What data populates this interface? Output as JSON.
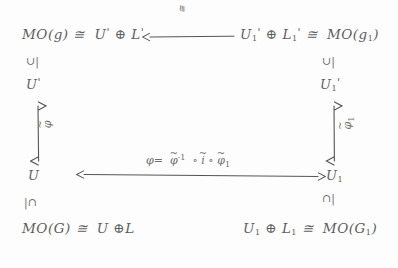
{
  "diagram": {
    "title_kind": "handwritten commutative diagram",
    "nodes": {
      "top_left": "MO(g) ≅ U' ⊕ L'",
      "top_right": "U₁' ⊕ L₁' ≅ MO(g₁)",
      "mid_left_upper": "U'",
      "mid_right_upper": "U₁'",
      "mid_left_lower": "U",
      "mid_right_lower": "U₁",
      "bottom_left": "MO(G) ≅ U ⊕ L",
      "bottom_right": "U₁ ⊕ L₁ ≅ MO(G₁)"
    },
    "parts": {
      "mo": "MO",
      "g_lower": "g",
      "g_upper": "G",
      "cong": "≅",
      "oplus": "⊕",
      "U": "U",
      "L": "L",
      "prime": "'",
      "one": "1",
      "paren_open": "(",
      "paren_close": ")"
    },
    "membership_marks": {
      "left_top": "∪|",
      "right_top": "∪|",
      "left_bottom": "|∩",
      "right_bottom": "∩|"
    },
    "arrows": {
      "top": {
        "name": "top-horizontal-arrow",
        "direction": "left",
        "label": "≅"
      },
      "bottom": {
        "name": "bottom-horizontal-arrow",
        "direction": "both",
        "label": "φ = φ̃⁻¹ ∘ ĩ ∘ φ̃₁"
      },
      "left": {
        "name": "left-vertical-arrow",
        "direction": "both",
        "label": "φ̃"
      },
      "right": {
        "name": "right-vertical-arrow",
        "direction": "both",
        "label": "φ̃₁"
      }
    },
    "formula_tokens": {
      "phi": "φ",
      "equals": "=",
      "tilde": "≈",
      "inv_exp": "-1",
      "compose": "∘",
      "i": "i",
      "sub_one": "1"
    },
    "colors": {
      "ink": "#5d5d5d",
      "paper": "#fdfdfd",
      "arrow": "#555555"
    }
  }
}
